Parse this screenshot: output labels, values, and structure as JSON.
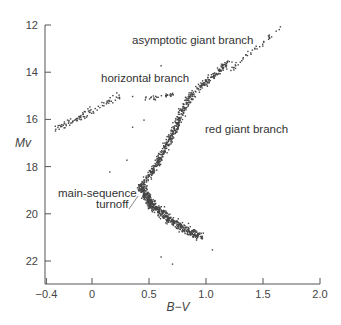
{
  "chart_data": {
    "type": "scatter",
    "title": "",
    "xlabel": "B−V",
    "ylabel": "Mv",
    "xlim": [
      -0.4,
      2.0
    ],
    "ylim": [
      23,
      12
    ],
    "y_inverted": true,
    "grid": false,
    "legend": null,
    "x_ticks": [
      "−0.4",
      "0",
      "0.5",
      "1.0",
      "1.5",
      "2.0"
    ],
    "x_tick_values": [
      -0.4,
      0,
      0.5,
      1.0,
      1.5,
      2.0
    ],
    "y_ticks": [
      "12",
      "14",
      "16",
      "18",
      "20",
      "22"
    ],
    "y_tick_values": [
      12,
      14,
      16,
      18,
      20,
      22
    ],
    "annotations": [
      {
        "text": "asymptotic giant branch",
        "x": 0.95,
        "y": 12.6
      },
      {
        "text": "horizontal branch",
        "x": 0.2,
        "y": 14.35
      },
      {
        "text": "red giant branch",
        "x": 1.12,
        "y": 16.35
      },
      {
        "text": "main-sequence",
        "x": 0.05,
        "y": 18.9
      },
      {
        "text": "turnoff",
        "x": 0.28,
        "y": 19.35
      }
    ],
    "series": [
      {
        "name": "horizontal branch (blue)",
        "segments": [
          [
            -0.33,
            16.4,
            0.23,
            15.0
          ]
        ],
        "count": 90,
        "spread": [
          0.04,
          0.25
        ]
      },
      {
        "name": "horizontal branch (red clump)",
        "segments": [
          [
            0.45,
            15.1,
            0.75,
            14.9
          ]
        ],
        "count": 30,
        "spread": [
          0.03,
          0.15
        ]
      },
      {
        "name": "asymptotic giant branch",
        "segments": [
          [
            1.2,
            13.9,
            1.65,
            12.1
          ]
        ],
        "count": 40,
        "spread": [
          0.03,
          0.15
        ]
      },
      {
        "name": "red giant branch",
        "segments": [
          [
            0.55,
            18.0,
            0.7,
            16.6
          ],
          [
            0.7,
            16.6,
            0.85,
            15.0
          ],
          [
            0.85,
            15.0,
            1.2,
            13.5
          ]
        ],
        "count": 420,
        "spread": [
          0.05,
          0.2
        ]
      },
      {
        "name": "subgiant branch",
        "segments": [
          [
            0.42,
            18.8,
            0.55,
            18.0
          ]
        ],
        "count": 80,
        "spread": [
          0.04,
          0.2
        ]
      },
      {
        "name": "main sequence",
        "segments": [
          [
            0.42,
            18.8,
            0.52,
            19.6
          ],
          [
            0.52,
            19.6,
            0.7,
            20.3
          ],
          [
            0.7,
            20.3,
            0.95,
            21.0
          ]
        ],
        "count": 520,
        "spread": [
          0.06,
          0.25
        ]
      },
      {
        "name": "field stars",
        "points": [
          [
            0.3,
            17.7
          ],
          [
            0.15,
            18.2
          ],
          [
            0.6,
            21.8
          ],
          [
            0.7,
            22.1
          ],
          [
            1.05,
            21.5
          ],
          [
            0.35,
            16.3
          ],
          [
            0.5,
            14.2
          ],
          [
            0.6,
            13.7
          ],
          [
            0.35,
            15.0
          ],
          [
            0.45,
            16.0
          ]
        ]
      }
    ]
  }
}
